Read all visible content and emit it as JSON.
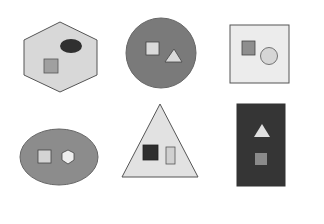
{
  "figure": {
    "layout": "2 rows x 3 columns",
    "panels": [
      {
        "id": "panel-1",
        "container": {
          "shape": "hexagon",
          "fill": "#d8d8d8",
          "stroke": "#555555"
        },
        "items": [
          {
            "shape": "ellipse",
            "fill": "#303030"
          },
          {
            "shape": "square",
            "fill": "#a0a0a0"
          }
        ]
      },
      {
        "id": "panel-2",
        "container": {
          "shape": "circle",
          "fill": "#7a7a7a",
          "stroke": "#666666"
        },
        "items": [
          {
            "shape": "square",
            "fill": "#dadada"
          },
          {
            "shape": "triangle",
            "fill": "#dadada"
          }
        ]
      },
      {
        "id": "panel-3",
        "container": {
          "shape": "square",
          "fill": "#ececec",
          "stroke": "#555555"
        },
        "items": [
          {
            "shape": "square",
            "fill": "#8e8e8e"
          },
          {
            "shape": "circle",
            "fill": "#d6d6d6"
          }
        ]
      },
      {
        "id": "panel-4",
        "container": {
          "shape": "ellipse",
          "fill": "#8c8c8c",
          "stroke": "#666666"
        },
        "items": [
          {
            "shape": "square",
            "fill": "#d4d4d4"
          },
          {
            "shape": "hexagon",
            "fill": "#eeeeee"
          }
        ]
      },
      {
        "id": "panel-5",
        "container": {
          "shape": "triangle",
          "fill": "#e2e2e2",
          "stroke": "#555555"
        },
        "items": [
          {
            "shape": "square",
            "fill": "#2e2e2e"
          },
          {
            "shape": "rectangle",
            "fill": "#d0d0d0"
          }
        ]
      },
      {
        "id": "panel-6",
        "container": {
          "shape": "rectangle",
          "fill": "#353535",
          "stroke": "#333333"
        },
        "items": [
          {
            "shape": "triangle",
            "fill": "#e0e0e0"
          },
          {
            "shape": "square",
            "fill": "#8a8a8a"
          }
        ]
      }
    ]
  }
}
